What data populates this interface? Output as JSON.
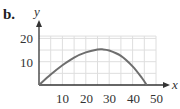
{
  "part_label": "b.",
  "chart_data": {
    "type": "line",
    "title": "",
    "xlabel": "x",
    "ylabel": "y",
    "xlim": [
      0,
      50
    ],
    "ylim": [
      0,
      21
    ],
    "grid": true,
    "grid_step": 5,
    "x_ticks": [
      "10",
      "20",
      "30",
      "40",
      "50"
    ],
    "y_ticks": [
      "10",
      "20"
    ],
    "series": [
      {
        "name": "curve",
        "x": [
          0,
          5,
          10,
          15,
          20,
          25,
          27,
          30,
          35,
          40,
          44,
          46
        ],
        "y": [
          0,
          4.5,
          8.5,
          11.8,
          14,
          15.2,
          15.3,
          14.8,
          12.5,
          8,
          3,
          0
        ]
      }
    ],
    "colors": {
      "curve": "#6e6e6e",
      "axis": "#333333",
      "grid": "#dedede"
    }
  }
}
